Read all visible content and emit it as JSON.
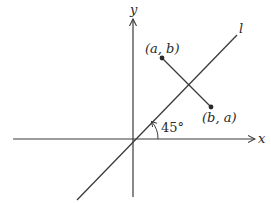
{
  "diagram": {
    "axes": {
      "x_label": "x",
      "y_label": "y"
    },
    "line": {
      "label": "l",
      "angle_label": "45°"
    },
    "points": [
      {
        "name": "point-a-b",
        "label": "(a, b)"
      },
      {
        "name": "point-b-a",
        "label": "(b, a)"
      }
    ],
    "colors": {
      "stroke": "#3a3a3a",
      "background": "#ffffff"
    }
  }
}
